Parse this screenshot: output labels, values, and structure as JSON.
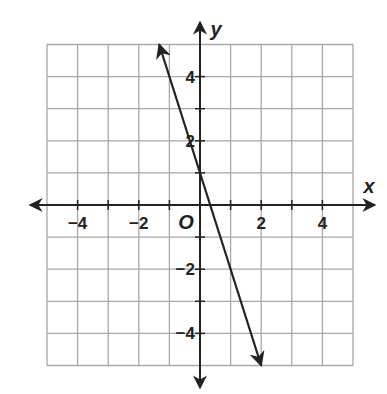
{
  "chart_data": {
    "type": "line",
    "title": "",
    "xlabel": "x",
    "ylabel": "y",
    "origin_label": "O",
    "xlim": [
      -5,
      5
    ],
    "ylim": [
      -5,
      5
    ],
    "grid": true,
    "x_ticks": [
      -4,
      -2,
      2,
      4
    ],
    "y_ticks": [
      4,
      2,
      -2,
      -4
    ],
    "x_tick_labels": [
      "−4",
      "−2",
      "2",
      "4"
    ],
    "y_tick_labels": [
      "4",
      "2",
      "−2",
      "−4"
    ],
    "series": [
      {
        "name": "line",
        "equation": "y = -3x + 1",
        "slope": -3,
        "y_intercept": 1,
        "x": [
          -1.333,
          2
        ],
        "y": [
          5,
          -5
        ],
        "arrows_both_ends": true,
        "color": "#222222"
      }
    ]
  }
}
